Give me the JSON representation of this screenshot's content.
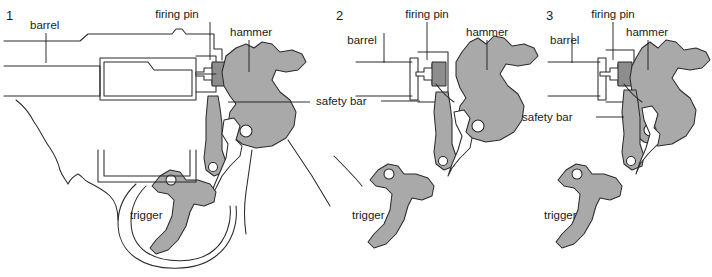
{
  "figure": {
    "background_color": "#ffffff",
    "ink_color": "#2b2b2b",
    "part_fill_color": "#a9a9a9"
  },
  "labels": {
    "barrel": "barrel",
    "firing_pin": "firing pin",
    "hammer": "hammer",
    "safety_bar": "safety bar",
    "trigger": "trigger"
  },
  "panels": [
    {
      "number": "1",
      "number_text": "1",
      "state": "at rest",
      "labels": {
        "barrel": "barrel",
        "firing_pin": "firing pin",
        "hammer": "hammer",
        "safety_bar": "safety bar",
        "trigger": "trigger"
      }
    },
    {
      "number": "2",
      "number_text": "2",
      "state": "hammer cocked, safety bar rising",
      "labels": {
        "barrel": "barrel",
        "firing_pin": "firing pin",
        "hammer": "hammer",
        "safety_bar": "safety bar",
        "trigger": "trigger"
      }
    },
    {
      "number": "3",
      "number_text": "3",
      "state": "hammer fallen, firing pin struck",
      "labels": {
        "barrel": "barrel",
        "firing_pin": "firing pin",
        "hammer": "hammer",
        "safety_bar": "safety bar",
        "trigger": "trigger"
      }
    }
  ]
}
